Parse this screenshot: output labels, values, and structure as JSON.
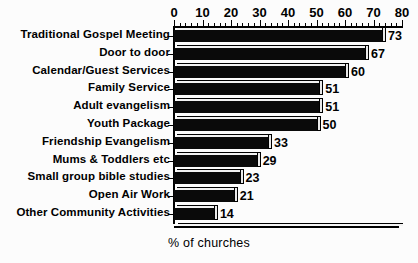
{
  "chart_data": {
    "type": "bar",
    "orientation": "horizontal",
    "title": "",
    "xlabel": "% of churches",
    "ylabel": "",
    "xlim": [
      0,
      80
    ],
    "xticks": [
      0,
      10,
      20,
      30,
      40,
      50,
      60,
      70,
      80
    ],
    "minor_tick_step": 2,
    "grid": false,
    "legend": false,
    "style": "3d-bar",
    "bar_color": "#0a0a0a",
    "background_color": "#fcfcfc",
    "categories": [
      "Traditional Gospel Meeting",
      "Door to door",
      "Calendar/Guest Services",
      "Family Service",
      "Adult evangelism",
      "Youth Package",
      "Friendship Evangelism",
      "Mums & Toddlers etc",
      "Small group bible studies",
      "Open Air Work",
      "Other Community Activities"
    ],
    "values": [
      73,
      67,
      60,
      51,
      51,
      50,
      33,
      29,
      23,
      21,
      14
    ],
    "data_labels": [
      "73",
      "67",
      "60",
      "51",
      "51",
      "50",
      "33",
      "29",
      "23",
      "21",
      "14"
    ],
    "tick_labels": [
      "0",
      "10",
      "20",
      "30",
      "40",
      "50",
      "60",
      "70",
      "80"
    ]
  }
}
